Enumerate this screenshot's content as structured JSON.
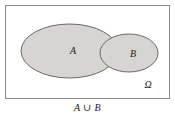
{
  "figure": {
    "caption": "A ∪ B",
    "universe_label": "Ω",
    "background_color": "#ffffff",
    "frame": {
      "name": "universe-rectangle",
      "stroke_color": "#8a8a8a",
      "fill_color": "#ffffff",
      "x": 5,
      "y": 5,
      "width": 165,
      "height": 94
    },
    "sets": [
      {
        "id": "A",
        "label": "A",
        "shape": "ellipse",
        "cx": 69.5,
        "cy": 51,
        "rx": 48.5,
        "ry": 27,
        "fill_color": "#d6d5d2",
        "stroke_color": "#6b6862",
        "label_x": 73,
        "label_y": 54
      },
      {
        "id": "B",
        "label": "B",
        "shape": "ellipse",
        "cx": 129,
        "cy": 53,
        "rx": 29,
        "ry": 19,
        "fill_color": "#d6d5d2",
        "stroke_color": "#6b6862",
        "label_x": 133,
        "label_y": 57
      }
    ],
    "shaded_region": "A ∪ B",
    "shade_color": "#d6d5d2",
    "universe_label_x": 148,
    "universe_label_y": 88
  }
}
